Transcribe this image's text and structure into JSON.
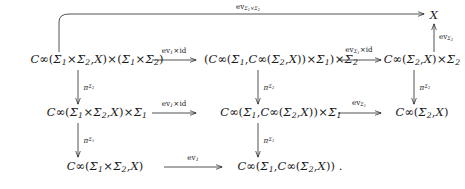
{
  "diagram": {
    "type": "commutative-diagram",
    "caption_punctuation": ".",
    "nodes": [
      {
        "id": "X",
        "text": "X",
        "row": 1,
        "col": 4,
        "x": 434,
        "y": 16
      },
      {
        "id": "r2c1",
        "text": "C∞(Σ1×Σ2,X)×(Σ1×Σ2)",
        "row": 2,
        "col": 1,
        "x": 97,
        "y": 60
      },
      {
        "id": "r2c2",
        "text": "(C∞(Σ1,C∞(Σ2,X))×Σ1)×Σ2",
        "row": 2,
        "col": 2,
        "x": 281,
        "y": 60
      },
      {
        "id": "r2c3",
        "text": "C∞(Σ2,X)×Σ2",
        "row": 2,
        "col": 3,
        "x": 422,
        "y": 60
      },
      {
        "id": "r3c1",
        "text": "C∞(Σ1×Σ2,X)×Σ1",
        "row": 3,
        "col": 1,
        "x": 97,
        "y": 113
      },
      {
        "id": "r3c2",
        "text": "C∞(Σ1,C∞(Σ2,X))×Σ1",
        "row": 3,
        "col": 2,
        "x": 281,
        "y": 113
      },
      {
        "id": "r3c3",
        "text": "C∞(Σ2,X)",
        "row": 3,
        "col": 3,
        "x": 422,
        "y": 113
      },
      {
        "id": "r4c1",
        "text": "C∞(Σ1×Σ2,X)",
        "row": 4,
        "col": 1,
        "x": 105,
        "y": 167
      },
      {
        "id": "r4c2",
        "text": "C∞(Σ1,C∞(Σ2,X))",
        "row": 4,
        "col": 2,
        "x": 290,
        "y": 167
      }
    ],
    "arrows": [
      {
        "id": "arrow-top-ev",
        "from": "r2c1",
        "to": "X",
        "label": "evΣ1×Σ2",
        "label_x": 248,
        "label_y": 8,
        "kind": "curved-horizontal"
      },
      {
        "id": "arrow-r2c1-r2c2",
        "from": "r2c1",
        "to": "r2c2",
        "label": "ev1×id",
        "label_x": 174,
        "label_y": 51,
        "kind": "horizontal"
      },
      {
        "id": "arrow-r2c2-r2c3",
        "from": "r2c2",
        "to": "r2c3",
        "label": "evΣ1×id",
        "label_x": 359,
        "label_y": 51,
        "kind": "horizontal"
      },
      {
        "id": "arrow-r2c3-X",
        "from": "r2c3",
        "to": "X",
        "label": "evΣ2",
        "label_x": 444,
        "label_y": 38,
        "kind": "vertical-up"
      },
      {
        "id": "arrow-r2c1-r3c1",
        "from": "r2c1",
        "to": "r3c1",
        "label": "πΣ2",
        "label_x": 88,
        "label_y": 88,
        "kind": "vertical-down"
      },
      {
        "id": "arrow-r2c2-r3c2",
        "from": "r2c2",
        "to": "r3c2",
        "label": "πΣ2",
        "label_x": 268,
        "label_y": 88,
        "kind": "vertical-down"
      },
      {
        "id": "arrow-r2c3-r3c3",
        "from": "r2c3",
        "to": "r3c3",
        "label": "πΣ2",
        "label_x": 424,
        "label_y": 88,
        "kind": "vertical-down"
      },
      {
        "id": "arrow-r3c1-r3c2",
        "from": "r3c1",
        "to": "r3c2",
        "label": "ev1×id",
        "label_x": 174,
        "label_y": 104,
        "kind": "horizontal"
      },
      {
        "id": "arrow-r3c2-r3c3",
        "from": "r3c2",
        "to": "r3c3",
        "label": "evΣ1",
        "label_x": 359,
        "label_y": 104,
        "kind": "horizontal"
      },
      {
        "id": "arrow-r3c1-r4c1",
        "from": "r3c1",
        "to": "r4c1",
        "label": "πΣ1",
        "label_x": 88,
        "label_y": 141,
        "kind": "vertical-down"
      },
      {
        "id": "arrow-r3c2-r4c2",
        "from": "r3c2",
        "to": "r4c2",
        "label": "πΣ1",
        "label_x": 268,
        "label_y": 141,
        "kind": "vertical-down"
      },
      {
        "id": "arrow-r4c1-r4c2",
        "from": "r4c1",
        "to": "r4c2",
        "label": "ev1",
        "label_x": 181,
        "label_y": 158,
        "kind": "horizontal"
      }
    ]
  },
  "symbols": {
    "C": "C",
    "infinity": "∞",
    "Sigma": "Σ",
    "pi": "π",
    "times": "×",
    "ev": "ev",
    "id": "id",
    "X": "X",
    "one": "1",
    "two": "2",
    "lparen": "(",
    "rparen": ")",
    "comma": ",",
    "period": "."
  },
  "colors": {
    "ink": "#1a1a1a",
    "background": "#ffffff"
  }
}
